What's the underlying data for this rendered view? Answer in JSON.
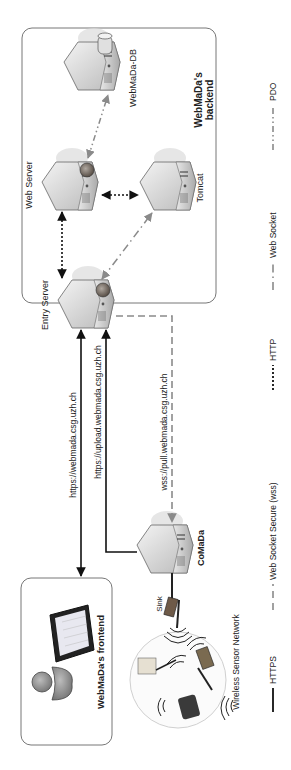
{
  "diagram": {
    "backend": {
      "title_line1": "WebMaDa's",
      "title_line2": "backend",
      "nodes": {
        "entry_server": "Entry Server",
        "web_server": "Web Server",
        "tomcat": "Tomcat",
        "db": "WebMaDa-DB"
      }
    },
    "frontend": {
      "title": "WebMaDa's frontend"
    },
    "comada": {
      "label": "CoMaDa"
    },
    "sensor_network": {
      "sink_label": "Sink",
      "label": "Wireless Sensor Network"
    },
    "connections": {
      "frontend_url": "https://webmada.csg.uzh.ch",
      "upload_url": "https://upload.webmada.csg.uzh.ch",
      "pull_url": "wss://pull.webmada.csg.uzh.ch"
    },
    "legend": [
      {
        "style": "solid",
        "label": "HTTPS"
      },
      {
        "style": "long-dash",
        "label": "Web Socket Secure (wss)"
      },
      {
        "style": "dotted",
        "label": "HTTP"
      },
      {
        "style": "dash-dot",
        "label": "Web Socket"
      },
      {
        "style": "dash-dot-dot",
        "label": "PDO"
      }
    ],
    "colors": {
      "solid_line": "#111111",
      "grey_line": "#8a8a8a",
      "box_border": "#777777",
      "server_body": "#d8d8d8"
    }
  }
}
